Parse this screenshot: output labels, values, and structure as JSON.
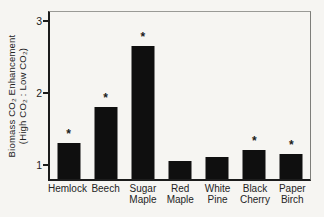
{
  "figure": {
    "background": "#f6f5f2",
    "bar_color": "#0f0f0f",
    "axis_color": "#1c1c1c",
    "text_color": "#242424"
  },
  "chart_data": {
    "type": "bar",
    "title": "",
    "ylabel_line1": "Biomass CO₂ Enhancement",
    "ylabel_line2": "(High CO₂ : Low CO₂)",
    "xlabel": "",
    "categories": [
      "Hemlock",
      "Beech",
      "Sugar Maple",
      "Red Maple",
      "White Pine",
      "Black Cherry",
      "Paper Birch"
    ],
    "category_lines": [
      [
        "Hemlock"
      ],
      [
        "Beech"
      ],
      [
        "Sugar",
        "Maple"
      ],
      [
        "Red",
        "Maple"
      ],
      [
        "White",
        "Pine"
      ],
      [
        "Black",
        "Cherry"
      ],
      [
        "Paper",
        "Birch"
      ]
    ],
    "values": [
      1.3,
      1.8,
      2.65,
      1.05,
      1.1,
      1.2,
      1.15
    ],
    "significant": [
      true,
      true,
      true,
      false,
      false,
      true,
      true
    ],
    "significance_marker": "*",
    "y_ticks": [
      "1",
      "2",
      "3"
    ],
    "ylim": [
      0.8,
      3.12
    ],
    "grid": false,
    "legend": null
  }
}
